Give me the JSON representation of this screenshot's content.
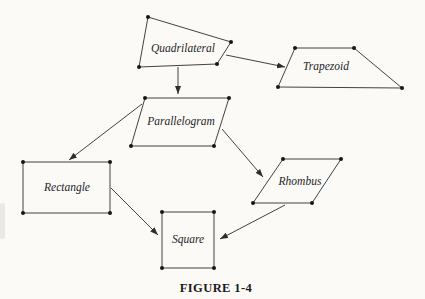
{
  "figure": {
    "caption": "FIGURE 1-4",
    "colors": {
      "background": "#fbfaf7",
      "line": "#2d2d2d",
      "dot": "#161616",
      "text": "#1e1e1e"
    },
    "nodes": [
      {
        "id": "quadrilateral",
        "label": "Quadrilateral",
        "points": "148,17 231,42 217,64 139,67",
        "label_x": 183,
        "label_y": 49
      },
      {
        "id": "trapezoid",
        "label": "Trapezoid",
        "points": "295,48 354,48 402,88 278,87",
        "label_x": 326,
        "label_y": 67
      },
      {
        "id": "parallelogram",
        "label": "Parallelogram",
        "points": "145,98 229,98 214,146 131,146",
        "label_x": 181,
        "label_y": 122
      },
      {
        "id": "rectangle",
        "label": "Rectangle",
        "points": "23,162 110,162 110,213 23,213",
        "label_x": 67,
        "label_y": 188
      },
      {
        "id": "rhombus",
        "label": "Rhombus",
        "points": "283,159 341,159 312,203 253,203",
        "label_x": 300,
        "label_y": 182
      },
      {
        "id": "square",
        "label": "Square",
        "points": "162,212 214,212 214,268 162,268",
        "label_x": 188,
        "label_y": 240
      }
    ],
    "edges": [
      {
        "from": "quadrilateral",
        "to": "trapezoid",
        "x1": 226,
        "y1": 55,
        "x2": 285,
        "y2": 67
      },
      {
        "from": "quadrilateral",
        "to": "parallelogram",
        "x1": 178,
        "y1": 67,
        "x2": 178,
        "y2": 94
      },
      {
        "from": "parallelogram",
        "to": "rectangle",
        "x1": 142,
        "y1": 104,
        "x2": 69,
        "y2": 160
      },
      {
        "from": "parallelogram",
        "to": "rhombus",
        "x1": 222,
        "y1": 129,
        "x2": 263,
        "y2": 177
      },
      {
        "from": "rectangle",
        "to": "square",
        "x1": 111,
        "y1": 188,
        "x2": 158,
        "y2": 235
      },
      {
        "from": "rhombus",
        "to": "square",
        "x1": 285,
        "y1": 205,
        "x2": 220,
        "y2": 239
      }
    ]
  }
}
